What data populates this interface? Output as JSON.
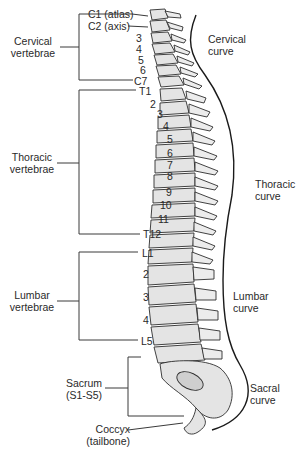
{
  "diagram": {
    "left_groups": [
      {
        "id": "cervical",
        "line1": "Cervical",
        "line2": "vertebrae"
      },
      {
        "id": "thoracic",
        "line1": "Thoracic",
        "line2": "vertebrae"
      },
      {
        "id": "lumbar",
        "line1": "Lumbar",
        "line2": "vertebrae"
      },
      {
        "id": "sacrum",
        "line1": "Sacrum",
        "line2": "(S1-S5)"
      },
      {
        "id": "coccyx",
        "line1": "Coccyx",
        "line2": "(tailbone)"
      }
    ],
    "vertebra_labels": {
      "c1": "C1 (atlas)",
      "c2": "C2 (axis)",
      "c3": "3",
      "c4": "4",
      "c5": "5",
      "c6": "6",
      "c7": "C7",
      "t1": "T1",
      "t2": "2",
      "t3": "3",
      "t4": "4",
      "t5": "5",
      "t6": "6",
      "t7": "7",
      "t8": "8",
      "t9": "9",
      "t10": "10",
      "t11": "11",
      "t12": "T12",
      "l1": "L1",
      "l2": "2",
      "l3": "3",
      "l4": "4",
      "l5": "L5"
    },
    "curves": [
      {
        "id": "cervical",
        "line1": "Cervical",
        "line2": "curve"
      },
      {
        "id": "thoracic",
        "line1": "Thoracic",
        "line2": "curve"
      },
      {
        "id": "lumbar",
        "line1": "Lumbar",
        "line2": "curve"
      },
      {
        "id": "sacral",
        "line1": "Sacral",
        "line2": "curve"
      }
    ],
    "colors": {
      "line": "#3a3a3a",
      "bone_fill": "#e4e4e4",
      "bone_stroke": "#2e2e2e",
      "disc": "#ffffff"
    }
  }
}
